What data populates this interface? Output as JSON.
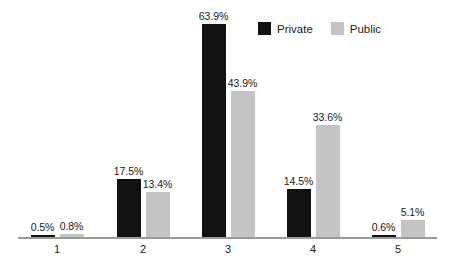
{
  "chart_data": {
    "type": "bar",
    "title": "",
    "subtitle": "",
    "xlabel": "",
    "ylabel": "",
    "categories": [
      "1",
      "2",
      "3",
      "4",
      "5"
    ],
    "series": [
      {
        "name": "Private",
        "color": "#111111",
        "values": [
          0.5,
          17.5,
          63.9,
          14.5,
          0.6
        ],
        "labels": [
          "0.5%",
          "17.5%",
          "63.9%",
          "14.5%",
          "0.6%"
        ]
      },
      {
        "name": "Public",
        "color": "#c4c4c4",
        "values": [
          0.8,
          13.4,
          43.9,
          33.6,
          5.1
        ],
        "labels": [
          "0.8%",
          "13.4%",
          "43.9%",
          "33.6%",
          "5.1%"
        ]
      }
    ],
    "ylim": [
      0,
      63.9
    ],
    "grid": false,
    "legend_position": "top-right",
    "axis_color": "#9a9a9a"
  },
  "legend": {
    "entries": [
      {
        "label": "Private"
      },
      {
        "label": "Public"
      }
    ]
  },
  "axis": {
    "ticks": [
      "1",
      "2",
      "3",
      "4",
      "5"
    ]
  }
}
